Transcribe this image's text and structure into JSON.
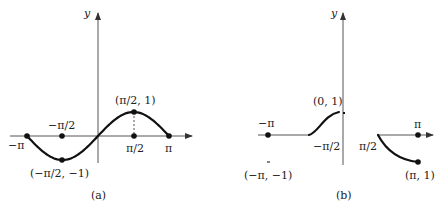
{
  "panels": [
    {
      "id": "a",
      "caption": "(a)",
      "y_axis_label": "y",
      "labels": {
        "neg_pi": "−π",
        "neg_half_pi": "−π/2",
        "half_pi": "π/2",
        "pi": "π",
        "max_point": "(π/2, 1)",
        "min_point": "(−π/2, −1)"
      },
      "function": "sin(x)",
      "domain": [
        "-pi",
        "pi"
      ],
      "marked_points": [
        {
          "x": "-pi",
          "y": 0
        },
        {
          "x": "-pi/2",
          "y": 0
        },
        {
          "x": "-pi/2",
          "y": -1
        },
        {
          "x": "pi/2",
          "y": 0
        },
        {
          "x": "pi/2",
          "y": 1
        },
        {
          "x": "pi",
          "y": 0
        }
      ]
    },
    {
      "id": "b",
      "caption": "(b)",
      "y_axis_label": "y",
      "labels": {
        "neg_pi": "−π",
        "neg_half_pi": "−π/2",
        "top_point": "(0, 1)",
        "half_pi": "π/2",
        "pi": "π",
        "left_point": "(−π, −1)",
        "right_point": "(π, 1)"
      }
    }
  ]
}
